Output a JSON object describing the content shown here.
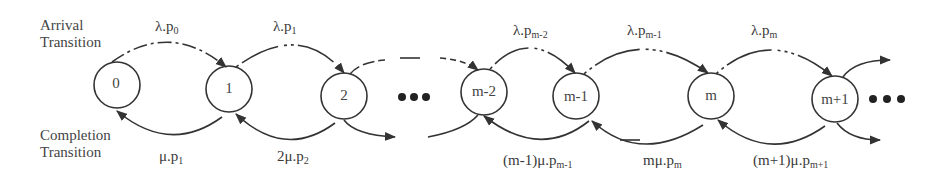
{
  "side_labels": {
    "arrival": [
      "Arrival",
      "Transition"
    ],
    "completion": [
      "Completion",
      "Transition"
    ]
  },
  "nodes": [
    {
      "id": "0",
      "label": "0",
      "cx": 117,
      "cy": 85
    },
    {
      "id": "1",
      "label": "1",
      "cx": 229,
      "cy": 89
    },
    {
      "id": "2",
      "label": "2",
      "cx": 344,
      "cy": 96
    },
    {
      "id": "m-2",
      "label": "m-2",
      "cx": 484,
      "cy": 92
    },
    {
      "id": "m-1",
      "label": "m-1",
      "cx": 576,
      "cy": 96
    },
    {
      "id": "m",
      "label": "m",
      "cx": 711,
      "cy": 96
    },
    {
      "id": "m+1",
      "label": "m+1",
      "cx": 835,
      "cy": 99
    }
  ],
  "arrival_labels": [
    {
      "base": "λ.p",
      "sub": "0"
    },
    {
      "base": "λ.p",
      "sub": "1"
    },
    {
      "base": "λ.p",
      "sub": "m-2"
    },
    {
      "base": "λ.p",
      "sub": "m-1"
    },
    {
      "base": "λ.p",
      "sub": "m"
    }
  ],
  "completion_labels": [
    {
      "base": "μ.p",
      "sub": "1"
    },
    {
      "base": "2μ.p",
      "sub": "2"
    },
    {
      "base": "(m-1)μ.p",
      "sub": "m-1"
    },
    {
      "base": "mμ.p",
      "sub": "m"
    },
    {
      "base": "(m+1)μ.p",
      "sub": "m+1"
    }
  ],
  "ellipsis": "•••",
  "colors": {
    "stroke": "#333333",
    "text": "#3a3a3a"
  }
}
